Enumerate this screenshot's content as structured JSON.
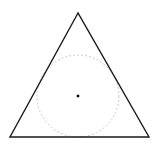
{
  "canvas": {
    "width": 157,
    "height": 146,
    "background": "#ffffff"
  },
  "triangle": {
    "points": [
      [
        78,
        13
      ],
      [
        10,
        137
      ],
      [
        149,
        137
      ]
    ],
    "stroke": "#1a1a1a",
    "stroke_width": 1.4
  },
  "incircle": {
    "cx": 78,
    "cy": 96,
    "r": 41,
    "stroke": "#c8c8c8",
    "stroke_width": 1,
    "dash": "2,2"
  },
  "center_point": {
    "cx": 78,
    "cy": 96,
    "size": 2.5,
    "fill": "#000000"
  }
}
